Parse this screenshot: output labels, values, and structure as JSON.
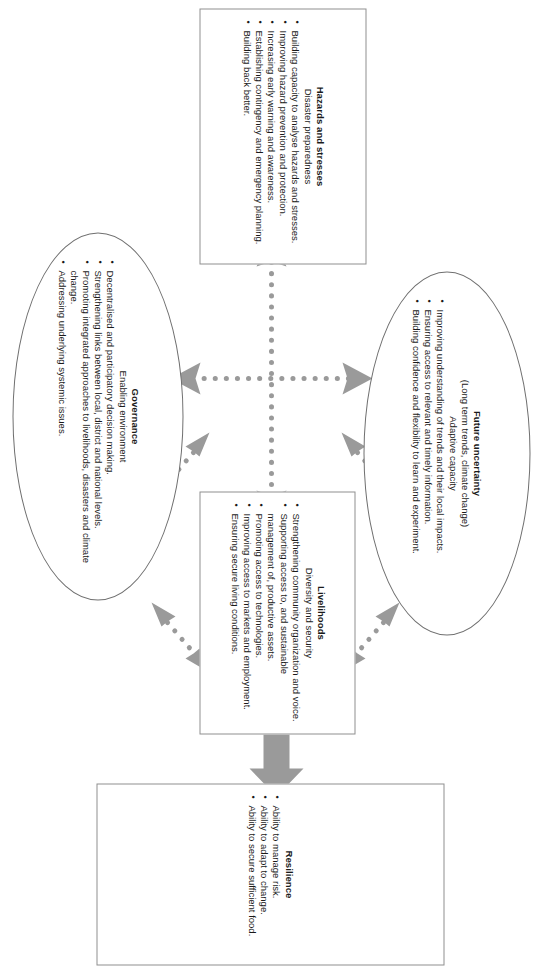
{
  "diagram": {
    "colors": {
      "connector": "#9a9a9a",
      "box_border": "#8f8f8f",
      "ellipse_border": "#6f6f6f",
      "text": "#1a1a1a",
      "background": "#ffffff"
    },
    "nodes": {
      "resilience": {
        "shape": "rectangle",
        "title": "Resilience",
        "subtitle": "",
        "bullets": [
          "Ability to manage risk.",
          "Ability to adapt to change.",
          "Ability to secure sufficient food."
        ]
      },
      "livelihoods": {
        "shape": "rectangle",
        "title": "Livelihoods",
        "subtitle": "Diversity and security",
        "bullets": [
          "Strengthening community organization and voice.",
          "Supporting access to, and sustainable management of, productive assets.",
          "Promoting access to technologies.",
          "Improving access to markets and employment.",
          "Ensuring secure living conditions."
        ]
      },
      "hazards": {
        "shape": "rectangle",
        "title": "Hazards and stresses",
        "subtitle": "Disaster preparedness",
        "bullets": [
          "Building capacity to analyse hazards and stresses.",
          "Improving hazard prevention and protection.",
          "Increasing early warning and awareness.",
          "Establishing contingency and emergency planning.",
          "Building back better."
        ]
      },
      "future_uncertainty": {
        "shape": "ellipse",
        "title": "Future uncertainty",
        "subtitle": "(Long term trends, climate change)",
        "subtitle2": "Adaptive capacity",
        "bullets": [
          "Improving understanding of trends and their local impacts.",
          "Ensuring access to relevant and timely information.",
          "Building confidence and  flexibility to learn and experiment."
        ]
      },
      "governance": {
        "shape": "ellipse",
        "title": "Governance",
        "subtitle": "Enabling environment",
        "bullets": [
          "Decentralised and participatory decision making.",
          "Strengthening links between local, district and national levels.",
          "Promoting integrated approaches to livelihoods, disasters and climate change.",
          "Addressing underlying systemic issues."
        ]
      }
    },
    "connectors": {
      "cross": "dotted double-headed cross linking hazards, livelihoods, future uncertainty and governance",
      "diagonals": "four short dotted double-headed arrows between adjacent nodes",
      "outcome_arrow": "solid block arrow pointing to Resilience"
    }
  }
}
